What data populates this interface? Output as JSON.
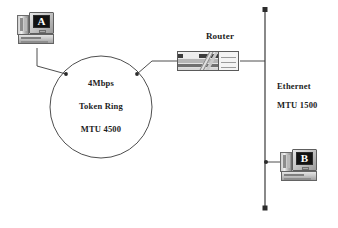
{
  "diagram": {
    "line_color": "#3a3a3a",
    "text_color": "#1c1c1c",
    "nodes": {
      "host_a": {
        "icon": "computer-workstation-icon",
        "screen_letter": "A"
      },
      "host_b": {
        "icon": "computer-workstation-icon",
        "screen_letter": "B"
      },
      "router": {
        "icon": "router-icon",
        "label": "Router"
      }
    },
    "networks": {
      "token_ring": {
        "shape": "circle",
        "lines": [
          "4Mbps",
          "Token Ring",
          "MTU 4500"
        ],
        "speed": "4Mbps",
        "type": "Token Ring",
        "mtu": "MTU 4500"
      },
      "ethernet": {
        "shape": "vertical-bus",
        "lines": [
          "Ethernet",
          "MTU 1500"
        ],
        "type": "Ethernet",
        "mtu": "MTU 1500"
      }
    },
    "links": [
      {
        "from": "host_a",
        "to": "token_ring"
      },
      {
        "from": "router",
        "to": "token_ring"
      },
      {
        "from": "router",
        "to": "ethernet"
      },
      {
        "from": "host_b",
        "to": "ethernet"
      }
    ]
  }
}
